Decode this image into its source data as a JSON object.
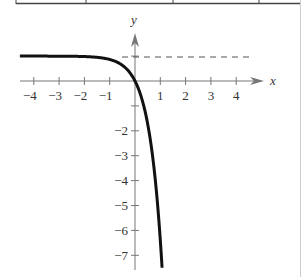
{
  "table_fragment": {
    "border_color": "#444444",
    "column_dividers_x": [
      16,
      86,
      173,
      259,
      300
    ]
  },
  "chart_data": {
    "type": "line",
    "title": "",
    "xlabel": "x",
    "ylabel": "y",
    "function": "y = 1 - e^(2x)",
    "xlim": [
      -4.5,
      4.8
    ],
    "ylim": [
      -7.5,
      1.9
    ],
    "x_ticks": [
      -4,
      -3,
      -2,
      -1,
      1,
      2,
      3,
      4
    ],
    "x_tick_labels": [
      "−4",
      "−3",
      "−2",
      "−1",
      "1",
      "2",
      "3",
      "4"
    ],
    "y_ticks": [
      1,
      -1,
      -2,
      -3,
      -4,
      -5,
      -6,
      -7
    ],
    "y_tick_labels": [
      "−2",
      "−3",
      "−4",
      "−5",
      "−6",
      "−7"
    ],
    "y_labeled_ticks": [
      -2,
      -3,
      -4,
      -5,
      -6,
      -7
    ],
    "asymptote": {
      "type": "horizontal",
      "y": 1,
      "style": "dashed"
    },
    "series": [
      {
        "name": "f(x)",
        "x": [
          -4.5,
          -4,
          -3,
          -2,
          -1.5,
          -1,
          -0.5,
          0,
          0.25,
          0.5,
          0.75,
          0.9,
          1.0,
          1.07
        ],
        "values": [
          1.0,
          1.0,
          1.0,
          0.98,
          0.95,
          0.86,
          0.63,
          0,
          -0.65,
          -1.72,
          -3.48,
          -5.05,
          -6.39,
          -7.5
        ]
      }
    ],
    "grid": false,
    "legend": null
  },
  "labels": {
    "x_axis": "x",
    "y_axis": "y"
  }
}
